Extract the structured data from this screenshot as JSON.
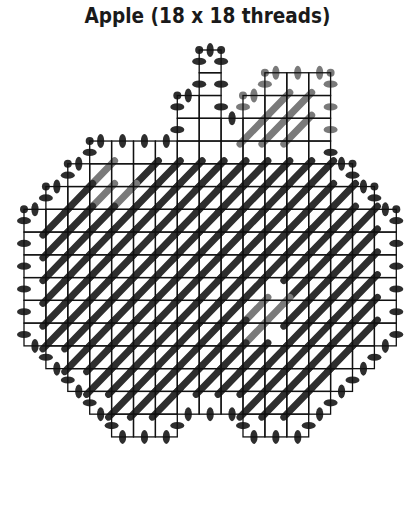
{
  "title": "Apple (18 x 18 threads)",
  "colors": {
    "grid": "#111111",
    "dark_stitch": "#2e2e2e",
    "light_stitch": "#7a7a7a",
    "background": "#ffffff"
  },
  "chart_data": {
    "type": "table",
    "title": "Apple (18 x 18 threads)",
    "grid": {
      "origin_x": 24,
      "origin_y": 50,
      "cell_w": 21.9,
      "cell_h": 22.76,
      "columns": 17,
      "rows": 17
    },
    "row_spans": [
      [
        [
          8,
          8
        ]
      ],
      [
        [
          8,
          8
        ],
        [
          11,
          13
        ]
      ],
      [
        [
          7,
          8
        ],
        [
          10,
          13
        ]
      ],
      [
        [
          7,
          13
        ]
      ],
      [
        [
          3,
          13
        ]
      ],
      [
        [
          2,
          14
        ]
      ],
      [
        [
          1,
          15
        ]
      ],
      [
        [
          0,
          16
        ]
      ],
      [
        [
          0,
          16
        ]
      ],
      [
        [
          0,
          16
        ]
      ],
      [
        [
          0,
          16
        ]
      ],
      [
        [
          0,
          16
        ]
      ],
      [
        [
          0,
          16
        ]
      ],
      [
        [
          1,
          15
        ]
      ],
      [
        [
          2,
          14
        ]
      ],
      [
        [
          3,
          13
        ]
      ],
      [
        [
          4,
          6
        ],
        [
          10,
          12
        ]
      ]
    ],
    "stitch_legend": [
      {
        "symbol": "dark-diagonal",
        "meaning": "apple body (dark red)"
      },
      {
        "symbol": "light-diagonal",
        "meaning": "leaf / highlight (light color)"
      },
      {
        "symbol": "dot",
        "meaning": "overcast edge"
      }
    ],
    "light_cells": [
      [
        2,
        11
      ],
      [
        2,
        12
      ],
      [
        3,
        10
      ],
      [
        3,
        11
      ],
      [
        3,
        12
      ],
      [
        5,
        3
      ],
      [
        6,
        3
      ],
      [
        6,
        4
      ],
      [
        11,
        10
      ],
      [
        11,
        11
      ],
      [
        12,
        10
      ]
    ],
    "empty_cells": [
      [
        0,
        8
      ],
      [
        1,
        8
      ],
      [
        2,
        7
      ],
      [
        2,
        8
      ],
      [
        3,
        7
      ],
      [
        3,
        8
      ],
      [
        3,
        9
      ],
      [
        1,
        11
      ],
      [
        1,
        12
      ],
      [
        1,
        13
      ],
      [
        2,
        10
      ],
      [
        2,
        13
      ],
      [
        3,
        13
      ],
      [
        4,
        3
      ],
      [
        4,
        4
      ],
      [
        4,
        5
      ],
      [
        4,
        6
      ],
      [
        4,
        7
      ],
      [
        4,
        8
      ],
      [
        4,
        9
      ],
      [
        4,
        10
      ],
      [
        4,
        11
      ],
      [
        4,
        12
      ],
      [
        4,
        13
      ],
      [
        5,
        2
      ],
      [
        5,
        4
      ],
      [
        5,
        14
      ],
      [
        6,
        1
      ],
      [
        6,
        15
      ],
      [
        7,
        0
      ],
      [
        7,
        16
      ],
      [
        8,
        0
      ],
      [
        8,
        16
      ],
      [
        9,
        0
      ],
      [
        9,
        16
      ],
      [
        10,
        0
      ],
      [
        10,
        16
      ],
      [
        11,
        0
      ],
      [
        11,
        16
      ],
      [
        12,
        0
      ],
      [
        12,
        16
      ],
      [
        13,
        1
      ],
      [
        13,
        15
      ],
      [
        14,
        2
      ],
      [
        14,
        14
      ],
      [
        15,
        3
      ],
      [
        15,
        13
      ],
      [
        16,
        4
      ],
      [
        16,
        5
      ],
      [
        16,
        6
      ],
      [
        16,
        10
      ],
      [
        16,
        11
      ],
      [
        16,
        12
      ],
      [
        15,
        7
      ],
      [
        15,
        8
      ],
      [
        15,
        9
      ],
      [
        10,
        11
      ],
      [
        12,
        11
      ]
    ]
  }
}
